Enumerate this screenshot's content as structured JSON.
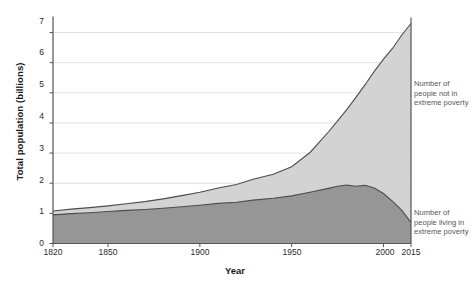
{
  "chart_data": {
    "type": "area",
    "title": "",
    "subtitle": "",
    "xlabel": "Year",
    "ylabel": "Total population (billions)",
    "xlim": [
      1820,
      2015
    ],
    "ylim": [
      0,
      7.4
    ],
    "grid": true,
    "stacked": true,
    "legend_position": "right-inline",
    "xticks": [
      1820,
      1850,
      1900,
      1950,
      2000,
      2015
    ],
    "xtick_labels": [
      "1820",
      "1850",
      "1900",
      "1950",
      "2000",
      "2015"
    ],
    "yticks": [
      0,
      1,
      2,
      3,
      4,
      5,
      6,
      7
    ],
    "ytick_labels": [
      "0",
      "1",
      "2",
      "3",
      "4",
      "5",
      "6",
      "7"
    ],
    "colors": {
      "not_in_poverty": "#d3d3d3",
      "in_poverty": "#969696",
      "line": "#4d4d4d",
      "grid": "#e2e2e2",
      "axis": "#555555",
      "text": "#2b2b2b",
      "annotation": "#55565a"
    },
    "x": [
      1820,
      1830,
      1840,
      1850,
      1860,
      1870,
      1880,
      1890,
      1900,
      1910,
      1920,
      1929,
      1940,
      1950,
      1960,
      1970,
      1975,
      1980,
      1985,
      1990,
      1995,
      2000,
      2005,
      2010,
      2015
    ],
    "series": [
      {
        "name": "Number of people living in extreme poverty",
        "key": "in_poverty",
        "color": "#969696",
        "values": [
          0.95,
          0.99,
          1.02,
          1.06,
          1.1,
          1.13,
          1.17,
          1.22,
          1.27,
          1.33,
          1.37,
          1.44,
          1.5,
          1.58,
          1.7,
          1.83,
          1.9,
          1.94,
          1.9,
          1.93,
          1.84,
          1.66,
          1.4,
          1.1,
          0.7
        ]
      },
      {
        "name": "Number of people not in extreme poverty",
        "key": "not_in_poverty",
        "color": "#d3d3d3",
        "values": [
          0.13,
          0.15,
          0.17,
          0.19,
          0.22,
          0.26,
          0.31,
          0.37,
          0.43,
          0.51,
          0.59,
          0.69,
          0.8,
          0.97,
          1.32,
          1.87,
          2.17,
          2.5,
          2.95,
          3.34,
          3.87,
          4.46,
          5.08,
          5.82,
          6.6
        ]
      },
      {
        "name": "Total population",
        "key": "total",
        "color": "#4d4d4d",
        "values": [
          1.08,
          1.14,
          1.19,
          1.25,
          1.32,
          1.39,
          1.48,
          1.59,
          1.7,
          1.84,
          1.96,
          2.13,
          2.3,
          2.55,
          3.02,
          3.7,
          4.07,
          4.44,
          4.85,
          5.27,
          5.71,
          6.12,
          6.48,
          6.92,
          7.3
        ]
      }
    ],
    "annotations": [
      {
        "id": "legend-upper",
        "text": "Number of\npeople not in\nextreme poverty",
        "lines": [
          "Number of",
          "people not in",
          "extreme poverty"
        ]
      },
      {
        "id": "legend-lower",
        "text": "Number of\npeople living in\nextreme poverty",
        "lines": [
          "Number of",
          "people living in",
          "extreme poverty"
        ]
      }
    ]
  },
  "axes": {
    "y_title": "Total population (billions)",
    "x_title": "Year",
    "y_ticks": [
      {
        "value": "7"
      },
      {
        "value": "6"
      },
      {
        "value": "5"
      },
      {
        "value": "4"
      },
      {
        "value": "3"
      },
      {
        "value": "2"
      },
      {
        "value": "1"
      },
      {
        "value": "0"
      }
    ],
    "x_ticks": [
      {
        "value": "1820"
      },
      {
        "value": "1850"
      },
      {
        "value": "1900"
      },
      {
        "value": "1950"
      },
      {
        "value": "2000"
      },
      {
        "value": "2015"
      }
    ]
  },
  "legend": {
    "upper": {
      "line1": "Number of",
      "line2": "people not in",
      "line3": "extreme poverty"
    },
    "lower": {
      "line1": "Number of",
      "line2": "people living in",
      "line3": "extreme poverty"
    }
  }
}
